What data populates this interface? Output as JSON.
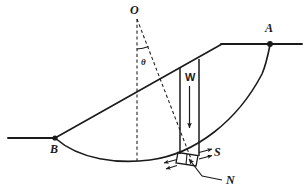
{
  "figure": {
    "type": "slope-stability-method-of-slices-diagram",
    "background_color": "#ffffff",
    "line_color": "#1a1a1a",
    "labels": {
      "center_of_rotation": "O",
      "slope_crest_point": "A",
      "slope_toe_point": "B",
      "angle": "θ",
      "slice_weight": "W",
      "shear_force": "S",
      "normal_force": "N"
    },
    "geometry": {
      "ground_left": {
        "x1": 8,
        "y1": 138,
        "x2": 55,
        "y2": 138
      },
      "slope_face": {
        "x1": 55,
        "y1": 138,
        "x2": 222,
        "y2": 44
      },
      "crest_top": {
        "x1": 222,
        "y1": 44,
        "x2": 302,
        "y2": 44
      },
      "point_O": {
        "x": 137,
        "y": 16
      },
      "point_A": {
        "x": 270,
        "y": 44
      },
      "point_B": {
        "x": 55,
        "y": 138
      },
      "arc_low_point": {
        "x": 140,
        "y": 162
      },
      "slice_left_x": 180,
      "slice_right_x": 199,
      "vertical_radius_dashed": {
        "x1": 137,
        "y1": 18,
        "x2": 137,
        "y2": 162
      },
      "inclined_radius_dashed": {
        "x1": 137,
        "y1": 18,
        "x2": 192,
        "y2": 160
      },
      "angle_arc_radius": 30
    }
  }
}
